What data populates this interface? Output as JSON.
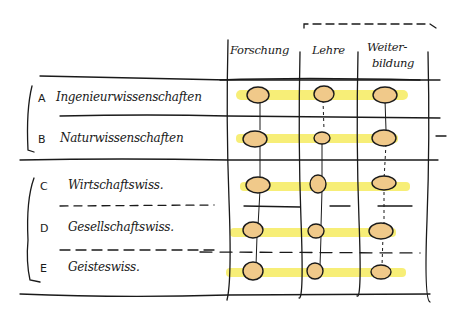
{
  "diagram": {
    "columns": [
      {
        "label": "Forschung"
      },
      {
        "label": "Lehre"
      },
      {
        "label": "Weiter-",
        "label2": "bildung"
      }
    ],
    "rows": [
      {
        "letter": "A",
        "label": "Ingenieurwissenschaften"
      },
      {
        "letter": "B",
        "label": "Naturwissenschaften"
      },
      {
        "letter": "C",
        "label": "Wirtschaftswiss."
      },
      {
        "letter": "D",
        "label": "Gesellschaftswiss."
      },
      {
        "letter": "E",
        "label": "Geisteswiss."
      }
    ],
    "colors": {
      "ink": "#1a1a1a",
      "highlight": "#f5e94a",
      "blob": "#f0c98a"
    }
  }
}
